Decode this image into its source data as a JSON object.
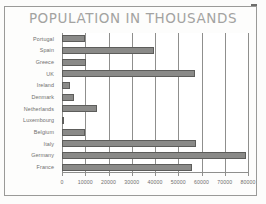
{
  "document": {
    "title": "POPULATION IN THOUSANDS",
    "artifact_name": "scan-dash-mark"
  },
  "chart_data": {
    "type": "bar",
    "orientation": "horizontal",
    "title": "POPULATION IN THOUSANDS",
    "xlabel": "",
    "ylabel": "",
    "xlim": [
      0,
      80000
    ],
    "grid": true,
    "legend": "none",
    "bar_color": "#8a8a88",
    "bar_edge_color": "#5d5d5b",
    "axis_color": "#8f8f8d",
    "title_color": "#a3a3a1",
    "label_color": "#6f6f6d",
    "xticks": [
      0,
      10000,
      20000,
      30000,
      40000,
      50000,
      60000,
      70000,
      80000
    ],
    "xticklabels": [
      "0",
      "10000",
      "20000",
      "30000",
      "40000",
      "50000",
      "60000",
      "70000",
      "80000"
    ],
    "categories": [
      "Portugal",
      "Spain",
      "Greece",
      "UK",
      "Ireland",
      "Denmark",
      "Netherlands",
      "Luxembourg",
      "Belgium",
      "Italy",
      "Germany",
      "France"
    ],
    "values": [
      9900,
      39500,
      10300,
      57000,
      3500,
      5100,
      15000,
      400,
      10000,
      57500,
      79000,
      56000
    ]
  }
}
